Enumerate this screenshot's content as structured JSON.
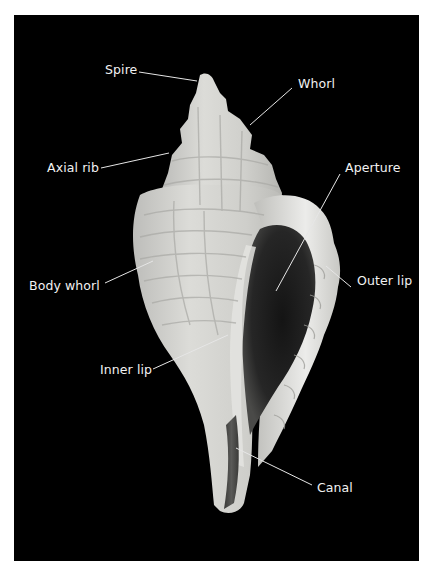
{
  "figure": {
    "background_color": "#000000",
    "label_color": "#f2f2f2",
    "shell_color": "#d9d9d6",
    "aperture_color": "#1a1a1a"
  },
  "labels": [
    {
      "id": "spire",
      "text": "Spire",
      "x": 91,
      "y": 55,
      "line": [
        125,
        57,
        183,
        66
      ]
    },
    {
      "id": "whorl",
      "text": "Whorl",
      "x": 284,
      "y": 69,
      "line": [
        278,
        73,
        236,
        110
      ]
    },
    {
      "id": "axial-rib",
      "text": "Axial rib",
      "x": 33,
      "y": 153,
      "line": [
        87,
        153,
        155,
        138
      ]
    },
    {
      "id": "aperture",
      "text": "Aperture",
      "x": 331,
      "y": 153,
      "line": [
        326,
        159,
        262,
        276
      ]
    },
    {
      "id": "body-whorl",
      "text": "Body whorl",
      "x": 15,
      "y": 271,
      "line": [
        91,
        268,
        139,
        246
      ]
    },
    {
      "id": "outer-lip",
      "text": "Outer lip",
      "x": 343,
      "y": 266,
      "line": [
        337,
        272,
        312,
        251
      ]
    },
    {
      "id": "inner-lip",
      "text": "Inner lip",
      "x": 86,
      "y": 355,
      "line": [
        139,
        354,
        214,
        320
      ]
    },
    {
      "id": "canal",
      "text": "Canal",
      "x": 303,
      "y": 473,
      "line": [
        298,
        470,
        222,
        433
      ]
    }
  ]
}
